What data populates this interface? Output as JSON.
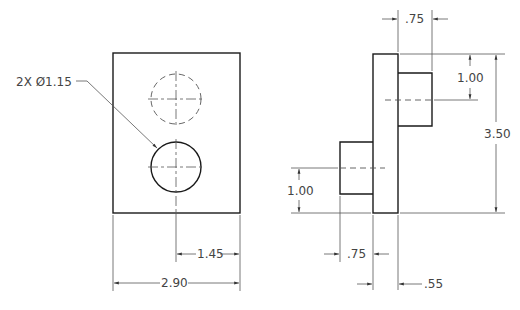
{
  "drawing": {
    "front_view": {
      "callout": "2X Ø1.15",
      "dim_center_to_edge": "1.45",
      "dim_width": "2.90"
    },
    "side_view": {
      "dim_top_boss_depth": ".75",
      "dim_top_boss_center": "1.00",
      "dim_height": "3.50",
      "dim_bottom_boss_center": "1.00",
      "dim_bottom_boss_depth": ".75",
      "dim_plate_thickness": ".55"
    },
    "colors": {
      "object_line": "#1a1a1a",
      "dimension_line": "#555555",
      "text": "#444444",
      "background": "#ffffff"
    }
  }
}
